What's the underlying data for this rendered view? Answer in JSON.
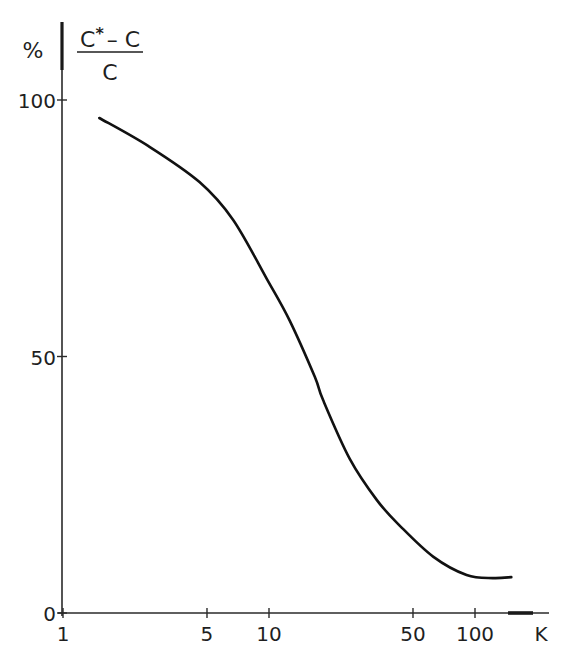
{
  "chart_data": {
    "type": "line",
    "title": "",
    "ylabel_unit": "%",
    "ylabel_fraction": {
      "numerator": "C* – C",
      "numerator_base": "C",
      "numerator_star": "*",
      "numerator_rest": "– C",
      "denominator": "C"
    },
    "xlabel": "K",
    "xscale": "log",
    "xlim": [
      1,
      200
    ],
    "ylim": [
      0,
      100
    ],
    "x_ticks": [
      1,
      5,
      10,
      50,
      100
    ],
    "x_tick_labels": [
      "1",
      "5",
      "10",
      "50",
      "100"
    ],
    "y_ticks": [
      0,
      50,
      100
    ],
    "y_tick_labels": [
      "0",
      "50",
      "100"
    ],
    "grid": false,
    "legend": null,
    "series": [
      {
        "name": "(C* - C)/C",
        "x": [
          1.5,
          2.6,
          4.6,
          6.7,
          9.8,
          12.6,
          16.7,
          18.3,
          24.7,
          33.4,
          43.2,
          62.6,
          91,
          122,
          150
        ],
        "values": [
          96.5,
          91,
          84,
          76.6,
          65,
          57,
          46,
          41.5,
          30,
          22,
          17,
          11,
          7.4,
          6.8,
          7
        ]
      }
    ]
  }
}
